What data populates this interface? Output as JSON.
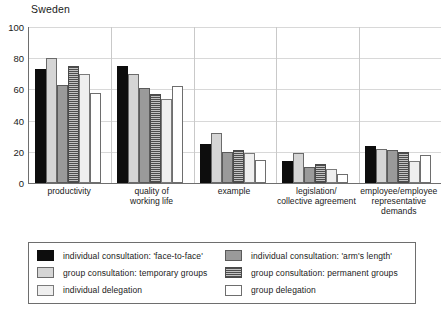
{
  "chart_data": {
    "type": "bar",
    "title": "Sweden",
    "xlabel": "",
    "ylabel": "",
    "ylim": [
      0,
      100
    ],
    "yticks": [
      0,
      20,
      40,
      60,
      80,
      100
    ],
    "grid": true,
    "legend_position": "bottom",
    "categories": [
      "productivity",
      "quality of\nworking life",
      "example",
      "legislation/\ncollective agreement",
      "employee/employee\nrepresentative\ndemands"
    ],
    "series": [
      {
        "name": "individual consultation: 'face-to-face'",
        "swatch": "s-black",
        "color": "#0d0d0d",
        "values": [
          73,
          75,
          25,
          14,
          24
        ]
      },
      {
        "name": "individual consultation: 'arm's length'",
        "swatch": "s-dkgray",
        "color": "#9a9a9a",
        "values": [
          63,
          61,
          20,
          10,
          21
        ]
      },
      {
        "name": "group consultation: temporary groups",
        "swatch": "s-ltgray",
        "color": "#d5d5d5",
        "values": [
          80,
          70,
          32,
          19,
          22
        ]
      },
      {
        "name": "group consultation: permanent groups",
        "swatch": "s-hatch",
        "color": "#9d9d9d",
        "values": [
          75,
          57,
          21,
          12,
          20
        ]
      },
      {
        "name": "individual delegation",
        "swatch": "s-pale",
        "color": "#efefef",
        "values": [
          70,
          54,
          19,
          9,
          14
        ]
      },
      {
        "name": "group delegation",
        "swatch": "s-white",
        "color": "#ffffff",
        "values": [
          58,
          62,
          15,
          6,
          18
        ]
      }
    ],
    "legend_order": [
      "individual consultation: 'face-to-face'",
      "individual consultation: 'arm's length'",
      "group consultation: temporary groups",
      "group consultation: permanent groups",
      "individual delegation",
      "group delegation"
    ],
    "bar_draw_order": [
      "individual consultation: 'face-to-face'",
      "group consultation: temporary groups",
      "individual consultation: 'arm's length'",
      "group consultation: permanent groups",
      "individual delegation",
      "group delegation"
    ]
  }
}
